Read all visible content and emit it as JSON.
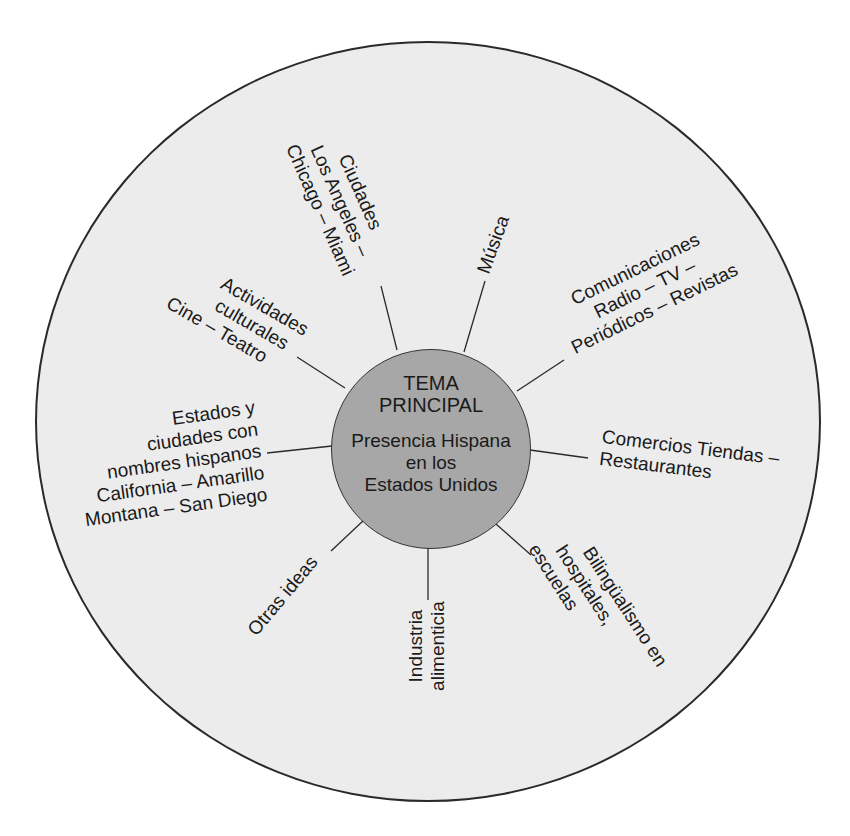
{
  "center": {
    "title_lines": [
      "TEMA",
      "PRINCIPAL"
    ],
    "subtitle_lines": [
      "Presencia Hispana",
      "en los",
      "Estados Unidos"
    ]
  },
  "branches": [
    {
      "id": "ciudades",
      "lines": [
        "Ciudades",
        "Los Angeles –",
        "Chicago – Miami"
      ]
    },
    {
      "id": "musica",
      "lines": [
        "Música"
      ]
    },
    {
      "id": "comunicaciones",
      "lines": [
        "Comunicaciones",
        "Radio – TV –",
        "Periódicos – Revistas"
      ]
    },
    {
      "id": "comercios",
      "lines": [
        "Comercios Tiendas –",
        "Restaurantes"
      ]
    },
    {
      "id": "bilingualismo",
      "lines": [
        "Bilingüalismo en",
        "hospitales,",
        "escuelas"
      ]
    },
    {
      "id": "industria",
      "lines": [
        "Industria",
        "alimenticia"
      ]
    },
    {
      "id": "otras",
      "lines": [
        "Otras ideas"
      ]
    },
    {
      "id": "estados",
      "lines": [
        "Estados y",
        "ciudades con",
        "nombres hispanos",
        "California – Amarillo",
        "Montana – San Diego"
      ]
    },
    {
      "id": "actividades",
      "lines": [
        "Actividades",
        "culturales",
        "Cine – Teatro"
      ]
    }
  ],
  "colors": {
    "outer_fill": "#ececec",
    "hub_fill": "#a7a7a7",
    "stroke": "#2a2a2a"
  }
}
